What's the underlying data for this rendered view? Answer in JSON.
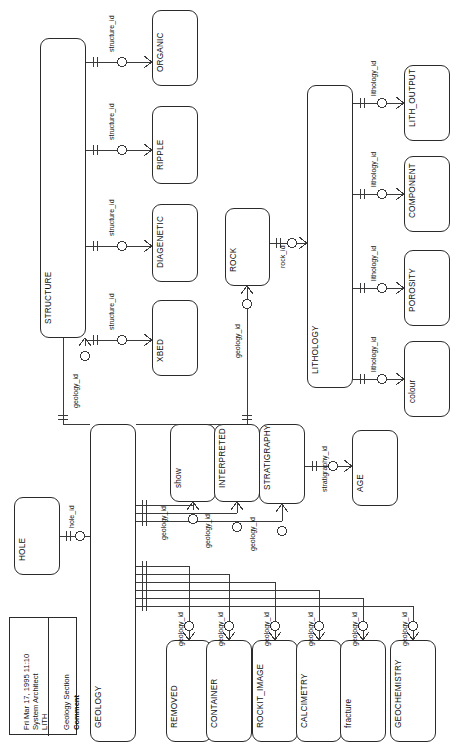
{
  "diagram": {
    "tool": "System Architect",
    "model": "LITH",
    "date": "Fri Mar 17, 1995  11:10",
    "comment_label": "Comment",
    "comment_value": "Geology Section",
    "notation": "crows-foot",
    "orientation": "rotated-90"
  },
  "entities": [
    {
      "id": "organic",
      "name": "ORGANIC",
      "x": 152,
      "y": 10,
      "w": 46,
      "h": 76
    },
    {
      "id": "ripple",
      "name": "RIPPLE",
      "x": 152,
      "y": 106,
      "w": 46,
      "h": 78
    },
    {
      "id": "diagenetic",
      "name": "DIAGENETIC",
      "x": 152,
      "y": 204,
      "w": 46,
      "h": 78
    },
    {
      "id": "xbed",
      "name": "XBED",
      "x": 152,
      "y": 300,
      "w": 46,
      "h": 76
    },
    {
      "id": "structure",
      "name": "STRUCTURE",
      "x": 40,
      "y": 38,
      "w": 46,
      "h": 300
    },
    {
      "id": "rock",
      "name": "ROCK",
      "x": 225,
      "y": 208,
      "w": 45,
      "h": 78
    },
    {
      "id": "lithology",
      "name": "LITHOLOGY",
      "x": 307,
      "y": 85,
      "w": 46,
      "h": 303
    },
    {
      "id": "lith_output",
      "name": "LITH_OUTPUT",
      "x": 404,
      "y": 65,
      "w": 46,
      "h": 76
    },
    {
      "id": "component",
      "name": "COMPONENT",
      "x": 404,
      "y": 156,
      "w": 46,
      "h": 76
    },
    {
      "id": "porosity",
      "name": "POROSITY",
      "x": 404,
      "y": 250,
      "w": 46,
      "h": 76
    },
    {
      "id": "colour",
      "name": "colour",
      "x": 404,
      "y": 341,
      "w": 46,
      "h": 76
    },
    {
      "id": "hole",
      "name": "HOLE",
      "x": 14,
      "y": 497,
      "w": 46,
      "h": 78
    },
    {
      "id": "geology",
      "name": "GEOLOGY",
      "x": 90,
      "y": 424,
      "w": 46,
      "h": 318
    },
    {
      "id": "show",
      "name": "show",
      "x": 170,
      "y": 424,
      "w": 46,
      "h": 78
    },
    {
      "id": "interpreted",
      "name": "INTERPRETED",
      "x": 214,
      "y": 424,
      "w": 46,
      "h": 78
    },
    {
      "id": "stratigraphy",
      "name": "STRATIGRAPHY",
      "x": 259,
      "y": 424,
      "w": 46,
      "h": 80
    },
    {
      "id": "age",
      "name": "AGE",
      "x": 352,
      "y": 430,
      "w": 46,
      "h": 76
    },
    {
      "id": "removed",
      "name": "REMOVED",
      "x": 166,
      "y": 640,
      "w": 46,
      "h": 102
    },
    {
      "id": "container",
      "name": "CONTAINER",
      "x": 206,
      "y": 640,
      "w": 46,
      "h": 102
    },
    {
      "id": "rockit_image",
      "name": "ROCKIT_IMAGE",
      "x": 252,
      "y": 640,
      "w": 46,
      "h": 102
    },
    {
      "id": "calcimetry",
      "name": "CALCIMETRY",
      "x": 296,
      "y": 640,
      "w": 46,
      "h": 102
    },
    {
      "id": "fracture",
      "name": "fracture",
      "x": 340,
      "y": 640,
      "w": 46,
      "h": 102
    },
    {
      "id": "geochemistry",
      "name": "GEOCHEMISTRY",
      "x": 390,
      "y": 640,
      "w": 46,
      "h": 102
    }
  ],
  "relationships": [
    {
      "id": "r1",
      "label": "structure_id",
      "from": "structure",
      "to": "organic"
    },
    {
      "id": "r2",
      "label": "structure_id",
      "from": "structure",
      "to": "ripple"
    },
    {
      "id": "r3",
      "label": "structure_id",
      "from": "structure",
      "to": "diagenetic"
    },
    {
      "id": "r4",
      "label": "structure_id",
      "from": "structure",
      "to": "xbed"
    },
    {
      "id": "r5",
      "label": "geology_id",
      "from": "geology",
      "to": "structure"
    },
    {
      "id": "r6",
      "label": "geology_id",
      "from": "geology",
      "to": "rock"
    },
    {
      "id": "r7",
      "label": "rock_id",
      "from": "rock",
      "to": "lithology"
    },
    {
      "id": "r8",
      "label": "lithology_id",
      "from": "lithology",
      "to": "lith_output"
    },
    {
      "id": "r9",
      "label": "lithology_id",
      "from": "lithology",
      "to": "component"
    },
    {
      "id": "r10",
      "label": "lithology_id",
      "from": "lithology",
      "to": "porosity"
    },
    {
      "id": "r11",
      "label": "lithology_id",
      "from": "lithology",
      "to": "colour"
    },
    {
      "id": "r12",
      "label": "hole_id",
      "from": "hole",
      "to": "geology"
    },
    {
      "id": "r13",
      "label": "geology_id",
      "from": "geology",
      "to": "show"
    },
    {
      "id": "r14",
      "label": "geology_id",
      "from": "geology",
      "to": "interpreted"
    },
    {
      "id": "r15",
      "label": "geology_id",
      "from": "geology",
      "to": "stratigraphy"
    },
    {
      "id": "r16",
      "label": "stratigraphy_id",
      "from": "stratigraphy",
      "to": "age"
    },
    {
      "id": "r17",
      "label": "geology_id",
      "from": "geology",
      "to": "removed"
    },
    {
      "id": "r18",
      "label": "geology_id",
      "from": "geology",
      "to": "container"
    },
    {
      "id": "r19",
      "label": "geology_id",
      "from": "geology",
      "to": "rockit_image"
    },
    {
      "id": "r20",
      "label": "geology_id",
      "from": "geology",
      "to": "calcimetry"
    },
    {
      "id": "r21",
      "label": "geology_id",
      "from": "geology",
      "to": "fracture"
    },
    {
      "id": "r22",
      "label": "geology_id",
      "from": "geology",
      "to": "geochemistry"
    }
  ]
}
